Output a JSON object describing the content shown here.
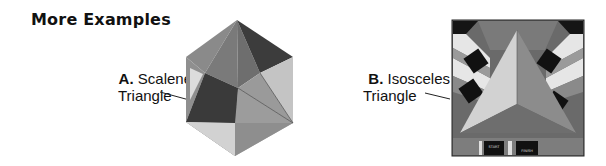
{
  "section": {
    "title": "More Examples"
  },
  "examples": [
    {
      "letter": "A.",
      "name_line1": "Scalene",
      "name_line2": "Triangle",
      "figure": "hexagon-pattern"
    },
    {
      "letter": "B.",
      "name_line1": "Isosceles",
      "name_line2": "Triangle",
      "figure": "square-floor-pattern",
      "panel_labels": [
        "START",
        "FINISH"
      ]
    }
  ],
  "colors": {
    "background": "#ffffff",
    "text": "#111111",
    "dark_gray": "#3a3a3a",
    "mid_gray": "#7a7a7a",
    "light_gray": "#c8c8c8",
    "pale_gray": "#e2e2e2",
    "black": "#111111"
  }
}
